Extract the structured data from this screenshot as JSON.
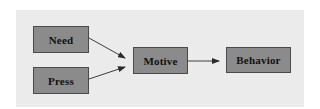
{
  "diagram": {
    "type": "flowchart",
    "nodes": [
      {
        "id": "need",
        "label": "Need"
      },
      {
        "id": "press",
        "label": "Press"
      },
      {
        "id": "motive",
        "label": "Motive"
      },
      {
        "id": "behavior",
        "label": "Behavior"
      }
    ],
    "edges": [
      {
        "from": "need",
        "to": "motive"
      },
      {
        "from": "press",
        "to": "motive"
      },
      {
        "from": "motive",
        "to": "behavior"
      }
    ]
  },
  "colors": {
    "panel_background": "#ebebeb",
    "node_fill": "#8b8b8b",
    "node_border": "#4a4a4a",
    "arrow": "#2a2a2a",
    "text": "#111111"
  }
}
